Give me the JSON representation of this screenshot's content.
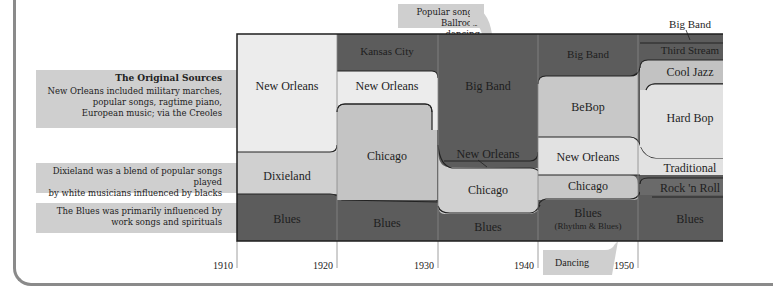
{
  "notes": {
    "original_sources": {
      "title": "The Original Sources",
      "text_lines": [
        "New Orleans included military marches,",
        "popular songs, ragtime piano,",
        "European music; via the Creoles"
      ]
    },
    "dixieland": {
      "text_lines": [
        "Dixieland was a blend of popular songs played",
        "by white musicians influenced by blacks"
      ]
    },
    "blues": {
      "text_lines": [
        "The Blues was primarily influenced by",
        "work songs and spirituals"
      ]
    },
    "popular_songs": {
      "text_lines": [
        "Popular songs,",
        "Ballroom dancing"
      ]
    },
    "dancing": {
      "text": "Dancing"
    },
    "big_band_top": {
      "text": "Big Band"
    }
  },
  "years": [
    "1910",
    "1920",
    "1930",
    "1940",
    "1950"
  ],
  "regions": {
    "new_orleans_1910": "New Orleans",
    "dixieland": "Dixieland",
    "blues_1910": "Blues",
    "kansas_city": "Kansas City",
    "new_orleans_1920": "New Orleans",
    "chicago_1920": "Chicago",
    "blues_1920": "Blues",
    "big_band_1930": "Big Band",
    "new_orleans_1930": "New Orleans",
    "chicago_1930": "Chicago",
    "blues_1930": "Blues",
    "big_band_1940": "Big Band",
    "bebop": "BeBop",
    "new_orleans_1940": "New Orleans",
    "chicago_1940": "Chicago",
    "blues_1940": "Blues",
    "rhythm_blues": "(Rhythm & Blues)",
    "third_stream": "Third Stream",
    "cool_jazz": "Cool Jazz",
    "hard_bop": "Hard Bop",
    "traditional": "Traditional",
    "rock_n_roll": "Rock 'n Roll",
    "blues_1950": "Blues"
  },
  "colors": {
    "dark": "#5c5c5c",
    "mid": "#a6a6a6",
    "light": "#d9d9d9",
    "lightest": "#ececec"
  }
}
